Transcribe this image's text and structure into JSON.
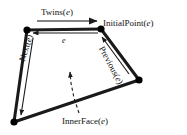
{
  "figure": {
    "type": "diagram",
    "background_color": "#ffffff",
    "stroke_color": "#1a1a1a",
    "vertex_color": "#000000",
    "labels": {
      "twins": "Twins(",
      "twins_arg": "e",
      "twins_close": ")",
      "initial_point": "InitialPoint(",
      "initial_point_arg": "e",
      "initial_point_close": ")",
      "next": "Next(",
      "next_arg": "e",
      "next_close": ")",
      "previous": "Previous(",
      "previous_arg": "e",
      "previous_close": ")",
      "inner_face": "InnerFace(",
      "inner_face_arg": "e",
      "inner_face_close": ")",
      "edge": "e"
    },
    "vertices": [
      {
        "name": "top-left",
        "x": 27,
        "y": 30
      },
      {
        "name": "top-right",
        "x": 101,
        "y": 29
      },
      {
        "name": "right",
        "x": 139,
        "y": 80
      },
      {
        "name": "bottom-left",
        "x": 14,
        "y": 122
      }
    ],
    "edges": [
      {
        "name": "top-edge",
        "from": "top-left",
        "to": "top-right"
      },
      {
        "name": "right-upper-edge",
        "from": "top-right",
        "to": "right"
      },
      {
        "name": "bottom-edge",
        "from": "right",
        "to": "bottom-left"
      },
      {
        "name": "left-edge",
        "from": "bottom-left",
        "to": "top-left"
      }
    ],
    "arrows": [
      {
        "name": "twins-arrow",
        "direction": "right",
        "along": "above top edge"
      },
      {
        "name": "edge-e-arrow",
        "direction": "left",
        "along": "below top edge"
      },
      {
        "name": "next-arrow",
        "direction": "down",
        "along": "inside left edge"
      },
      {
        "name": "previous-arrow",
        "direction": "up",
        "along": "inside right upper edge"
      },
      {
        "name": "innerface-arrow",
        "direction": "up",
        "style": "dashed",
        "along": "into face interior"
      }
    ]
  }
}
